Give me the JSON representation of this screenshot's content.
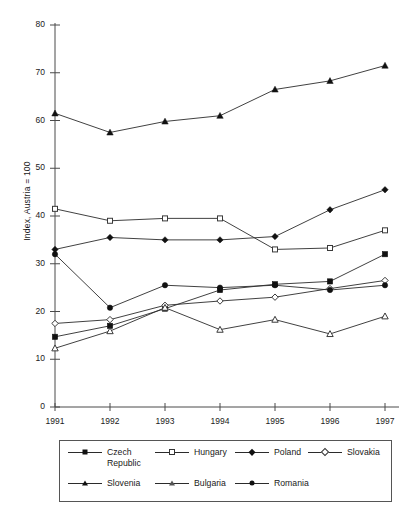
{
  "chart_data": {
    "type": "line",
    "title": "",
    "xlabel": "",
    "ylabel": "Index, Austria = 100",
    "categories": [
      "1991",
      "1992",
      "1993",
      "1994",
      "1995",
      "1996",
      "1997"
    ],
    "x": [
      1991,
      1992,
      1993,
      1994,
      1995,
      1996,
      1997
    ],
    "ylim": [
      0,
      80
    ],
    "xlim": [
      1991,
      1997
    ],
    "y_ticks": [
      0,
      10,
      20,
      30,
      40,
      50,
      60,
      70,
      80
    ],
    "y_tick_labels": [
      "0",
      "10",
      "20",
      "30",
      "40",
      "50",
      "60",
      "70",
      "80"
    ],
    "x_ticks": [
      1991,
      1992,
      1993,
      1994,
      1995,
      1996,
      1997
    ],
    "x_tick_labels": [
      "1991",
      "1992",
      "1993",
      "1994",
      "1995",
      "1996",
      "1997"
    ],
    "grid": false,
    "legend_position": "bottom",
    "line_color": "#2b2b2b",
    "series": [
      {
        "name": "Czech Republic",
        "legend_label": "Czech\nRepublic",
        "marker": "filled-square",
        "values": [
          14.7,
          17.0,
          20.6,
          24.5,
          25.7,
          26.3,
          32.0
        ]
      },
      {
        "name": "Hungary",
        "legend_label": "Hungary",
        "marker": "open-square",
        "values": [
          41.5,
          39.0,
          39.5,
          39.5,
          33.0,
          33.3,
          37.0
        ]
      },
      {
        "name": "Poland",
        "legend_label": "Poland",
        "marker": "filled-diamond",
        "values": [
          33.0,
          35.5,
          35.0,
          35.0,
          35.7,
          41.3,
          45.5
        ]
      },
      {
        "name": "Slovakia",
        "legend_label": "Slovakia",
        "marker": "open-diamond",
        "values": [
          17.5,
          18.3,
          21.3,
          22.2,
          23.0,
          24.8,
          26.5
        ]
      },
      {
        "name": "Slovenia",
        "legend_label": "Slovenia",
        "marker": "filled-triangle",
        "values": [
          61.5,
          57.5,
          59.8,
          61.0,
          66.5,
          68.3,
          71.5
        ]
      },
      {
        "name": "Bulgaria",
        "legend_label": "Bulgaria",
        "marker": "open-triangle",
        "values": [
          12.3,
          15.9,
          20.8,
          16.2,
          18.3,
          15.3,
          19.0
        ]
      },
      {
        "name": "Romania",
        "legend_label": "Romania",
        "marker": "filled-circle",
        "values": [
          32.0,
          20.8,
          25.5,
          25.0,
          25.5,
          24.5,
          25.5
        ]
      }
    ]
  },
  "legend": {
    "rows": [
      [
        {
          "label": "Czech\nRepublic",
          "marker": "filled-square",
          "left": 8,
          "width": 108
        },
        {
          "label": "Hungary",
          "marker": "open-square",
          "left": 95,
          "width": 96
        },
        {
          "label": "Poland",
          "marker": "filled-diamond",
          "left": 175,
          "width": 88
        },
        {
          "label": "Slovakia",
          "marker": "open-diamond",
          "left": 248,
          "width": 90
        }
      ],
      [
        {
          "label": "Slovenia",
          "marker": "filled-triangle",
          "left": 8,
          "width": 96
        },
        {
          "label": "Bulgaria",
          "marker": "open-triangle",
          "left": 95,
          "width": 96
        },
        {
          "label": "Romania",
          "marker": "filled-circle",
          "left": 175,
          "width": 96
        }
      ]
    ]
  }
}
